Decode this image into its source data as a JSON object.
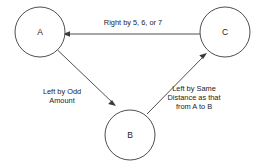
{
  "diagram": {
    "type": "directed-graph",
    "title": "",
    "background_color": "#ffffff",
    "stroke_color": "#3a3a3a",
    "text_color": "#1c1c1c",
    "nodes": [
      {
        "id": "A",
        "label": "A",
        "cx": 40,
        "cy": 32,
        "r": 25
      },
      {
        "id": "C",
        "label": "C",
        "cx": 225,
        "cy": 32,
        "r": 25
      },
      {
        "id": "B",
        "label": "B",
        "cx": 130,
        "cy": 135,
        "r": 25
      }
    ],
    "edges": [
      {
        "id": "c-to-a",
        "from": "C",
        "to": "A",
        "label": "Right by 5, 6, or 7",
        "label_lines": [
          "Right by 5, 6, or 7"
        ]
      },
      {
        "id": "a-to-b",
        "from": "A",
        "to": "B",
        "label": "Left by Odd Amount",
        "label_lines": [
          "Left by Odd",
          "Amount"
        ]
      },
      {
        "id": "b-to-c",
        "from": "B",
        "to": "C",
        "label": "Left by Same Distance as that from A to B",
        "label_lines": [
          "Left by Same",
          "Distance as that",
          "from A to B"
        ]
      }
    ]
  }
}
